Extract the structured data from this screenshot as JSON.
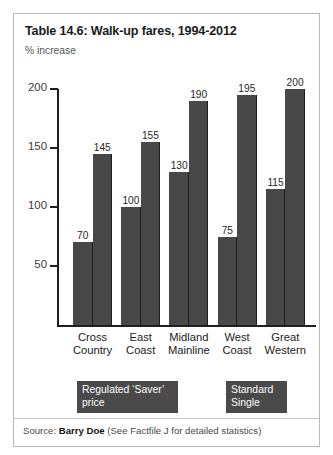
{
  "card": {
    "title": "Table 14.6: Walk-up fares, 1994-2012",
    "axis_unit": "% increase"
  },
  "source": {
    "prefix": "Source: ",
    "author": "Barry Doe",
    "note": " (See Factfile J for detailed statistics)"
  },
  "legend": [
    {
      "name": "regulated",
      "line1": "Regulated ‘Saver’",
      "line2": "price"
    },
    {
      "name": "standard",
      "line1": "Standard",
      "line2": "Single"
    }
  ],
  "chart_data": {
    "type": "bar",
    "title": "Table 14.6: Walk-up fares, 1994-2012",
    "xlabel": "",
    "ylabel": "% increase",
    "ylim": [
      0,
      210
    ],
    "yticks": [
      50,
      100,
      150,
      200
    ],
    "grid": false,
    "legend_position": "below-axis",
    "categories": [
      {
        "line1": "Cross",
        "line2": "Country"
      },
      {
        "line1": "East",
        "line2": "Coast"
      },
      {
        "line1": "Midland",
        "line2": "Mainline"
      },
      {
        "line1": "West",
        "line2": "Coast"
      },
      {
        "line1": "Great",
        "line2": "Western"
      }
    ],
    "series": [
      {
        "name": "Regulated ‘Saver’ price",
        "values": [
          70,
          100,
          130,
          75,
          115
        ]
      },
      {
        "name": "Standard Single",
        "values": [
          145,
          155,
          190,
          195,
          200
        ]
      }
    ],
    "bar_color": "#484848"
  }
}
